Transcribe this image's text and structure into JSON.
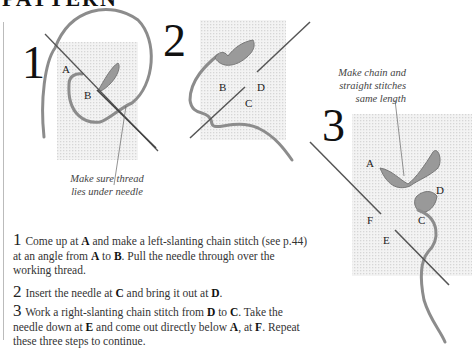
{
  "page": {
    "heading": "PATTERN"
  },
  "diagram": {
    "steps": [
      {
        "number": "1",
        "labels": [
          "A",
          "B"
        ],
        "caption_line1": "Make sure thread",
        "caption_line2": "lies under needle"
      },
      {
        "number": "2",
        "labels": [
          "B",
          "D",
          "C"
        ]
      },
      {
        "number": "3",
        "labels": [
          "A",
          "D",
          "F",
          "C",
          "E"
        ],
        "caption_line1": "Make chain and",
        "caption_line2": "straight stitches",
        "caption_line3": "same length"
      }
    ],
    "colors": {
      "thread": "#8a8a8a",
      "needle": "#555555",
      "fabric_grid": "#e4e4e4"
    }
  },
  "instructions": [
    {
      "number": "1",
      "parts": [
        "Come up at ",
        "A",
        " and make a left-slanting chain stitch (see p.44) at an angle from ",
        "A",
        " to ",
        "B",
        ". Pull the needle through over the working thread."
      ]
    },
    {
      "number": "2",
      "parts": [
        "Insert the needle at ",
        "C",
        " and bring it out at ",
        "D",
        "."
      ]
    },
    {
      "number": "3",
      "parts": [
        "Work a right-slanting chain stitch from ",
        "D",
        " to ",
        "C",
        ". Take the needle down at ",
        "E",
        " and come out directly below ",
        "A",
        ", at ",
        "F",
        ". Repeat these three steps to continue."
      ]
    }
  ]
}
